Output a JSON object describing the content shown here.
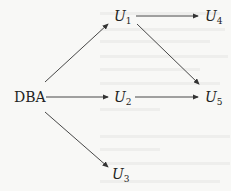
{
  "diagram": {
    "nodes": [
      {
        "id": "DBA",
        "label": "DBA",
        "sub": ""
      },
      {
        "id": "U1",
        "label": "U",
        "sub": "1"
      },
      {
        "id": "U2",
        "label": "U",
        "sub": "2"
      },
      {
        "id": "U3",
        "label": "U",
        "sub": "3"
      },
      {
        "id": "U4",
        "label": "U",
        "sub": "4"
      },
      {
        "id": "U5",
        "label": "U",
        "sub": "5"
      }
    ],
    "edges": [
      {
        "from": "DBA",
        "to": "U1"
      },
      {
        "from": "DBA",
        "to": "U2"
      },
      {
        "from": "DBA",
        "to": "U3"
      },
      {
        "from": "U1",
        "to": "U4"
      },
      {
        "from": "U1",
        "to": "U5"
      },
      {
        "from": "U2",
        "to": "U5"
      }
    ],
    "colors": {
      "line": "#333333",
      "text": "#222222",
      "background": "#f8f8f6"
    }
  }
}
